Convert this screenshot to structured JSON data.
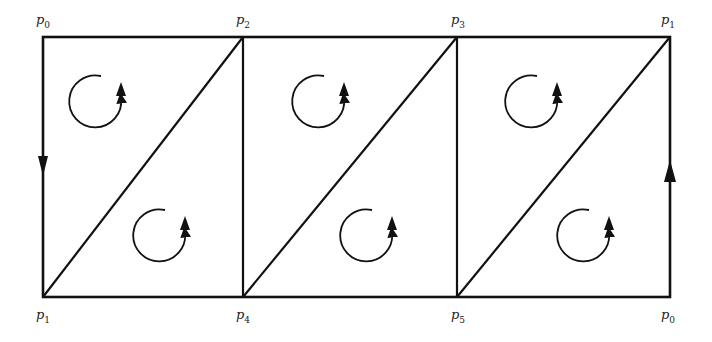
{
  "diagram": {
    "colors": {
      "stroke": "#111111",
      "background": "#ffffff"
    },
    "labels": [
      {
        "id": "top-0",
        "base": "p",
        "sub": "0",
        "x": 36,
        "y": 13
      },
      {
        "id": "top-1",
        "base": "p",
        "sub": "2",
        "x": 236,
        "y": 13
      },
      {
        "id": "top-2",
        "base": "p",
        "sub": "3",
        "x": 451,
        "y": 13
      },
      {
        "id": "top-3",
        "base": "p",
        "sub": "1",
        "x": 661,
        "y": 13
      },
      {
        "id": "bot-0",
        "base": "p",
        "sub": "1",
        "x": 36,
        "y": 308
      },
      {
        "id": "bot-1",
        "base": "p",
        "sub": "4",
        "x": 236,
        "y": 308
      },
      {
        "id": "bot-2",
        "base": "p",
        "sub": "5",
        "x": 451,
        "y": 308
      },
      {
        "id": "bot-3",
        "base": "p",
        "sub": "0",
        "x": 661,
        "y": 308
      }
    ],
    "columns_x": [
      43,
      243,
      457,
      670
    ],
    "top_y": 37,
    "bottom_y": 297,
    "edge_arrows": [
      {
        "edge": "left",
        "direction": "down"
      },
      {
        "edge": "right",
        "direction": "up"
      }
    ],
    "rotation_arrows": [
      {
        "cx": 97,
        "cy": 102
      },
      {
        "cx": 161,
        "cy": 236
      },
      {
        "cx": 320,
        "cy": 102
      },
      {
        "cx": 368,
        "cy": 236
      },
      {
        "cx": 533,
        "cy": 102
      },
      {
        "cx": 585,
        "cy": 236
      }
    ]
  }
}
